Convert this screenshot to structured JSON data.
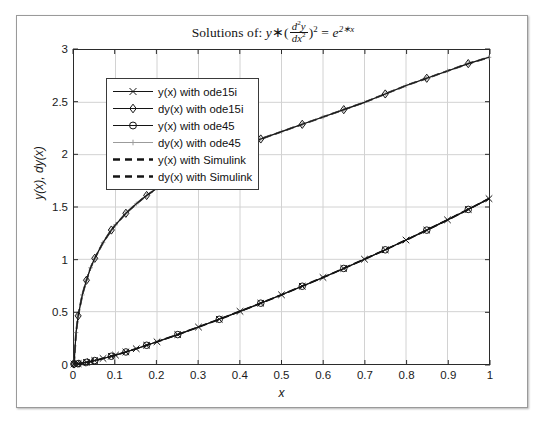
{
  "figure": {
    "title_parts": {
      "prefix": "Solutions of:",
      "y": "y",
      "times": "∗",
      "open_paren": "(",
      "num_d": "d",
      "num_sup": "2",
      "num_y": "y",
      "den_d": "d",
      "den_x": "x",
      "den_sup": "2",
      "close_paren": ")",
      "paren_sup": "2",
      "equals": "=",
      "e": "e",
      "e_sup": "2∗x"
    },
    "title_plain": "Solutions of: y * (d^2y/dx^2)^2 = e^(2*x)"
  },
  "axes": {
    "xlabel": "x",
    "ylabel": "y(x), dy(x)",
    "xticks": [
      "0",
      "0.1",
      "0.2",
      "0.3",
      "0.4",
      "0.5",
      "0.6",
      "0.7",
      "0.8",
      "0.9",
      "1"
    ],
    "yticks": [
      "0",
      "0.5",
      "1",
      "1.5",
      "2",
      "2.5",
      "3"
    ]
  },
  "legend": {
    "entries": [
      {
        "label": "y(x) with ode15i",
        "marker": "x-mark",
        "style": "solid",
        "color": "#141414"
      },
      {
        "label": "dy(x) with ode15i",
        "marker": "diamond",
        "style": "solid",
        "color": "#141414"
      },
      {
        "label": "y(x) with ode45",
        "marker": "circle",
        "style": "solid",
        "color": "#141414"
      },
      {
        "label": "dy(x) with ode45",
        "marker": "plus",
        "style": "solid",
        "color": "#9b9b9b"
      },
      {
        "label": "y(x) with Simulink",
        "marker": "none",
        "style": "dashed",
        "color": "#141414"
      },
      {
        "label": "dy(x) with Simulink",
        "marker": "none",
        "style": "dashed",
        "color": "#141414"
      }
    ]
  },
  "chart_data": {
    "type": "line",
    "xlabel": "x",
    "ylabel": "y(x), dy(x)",
    "xlim": [
      0,
      1
    ],
    "ylim": [
      0,
      3
    ],
    "xticks": [
      0,
      0.1,
      0.2,
      0.3,
      0.4,
      0.5,
      0.6,
      0.7,
      0.8,
      0.9,
      1
    ],
    "yticks": [
      0,
      0.5,
      1,
      1.5,
      2,
      2.5,
      3
    ],
    "grid": true,
    "legend_position": "upper left",
    "x": [
      0,
      0.005,
      0.01,
      0.02,
      0.03,
      0.04,
      0.05,
      0.07,
      0.09,
      0.1,
      0.125,
      0.15,
      0.175,
      0.2,
      0.25,
      0.3,
      0.35,
      0.4,
      0.45,
      0.5,
      0.55,
      0.6,
      0.65,
      0.7,
      0.75,
      0.8,
      0.85,
      0.9,
      0.95,
      1.0
    ],
    "series": [
      {
        "name": "dy(x) with ode15i",
        "marker": "diamond",
        "style": "solid",
        "values": [
          0,
          0.3,
          0.46,
          0.66,
          0.8,
          0.92,
          1.01,
          1.16,
          1.28,
          1.33,
          1.44,
          1.53,
          1.61,
          1.68,
          1.8,
          1.9,
          1.99,
          2.07,
          2.15,
          2.22,
          2.29,
          2.36,
          2.43,
          2.5,
          2.58,
          2.66,
          2.73,
          2.8,
          2.87,
          2.93
        ]
      },
      {
        "name": "dy(x) with ode45",
        "marker": "plus",
        "style": "solid",
        "values": [
          0,
          0.3,
          0.46,
          0.66,
          0.8,
          0.92,
          1.01,
          1.16,
          1.28,
          1.33,
          1.44,
          1.53,
          1.61,
          1.68,
          1.8,
          1.9,
          1.99,
          2.07,
          2.15,
          2.22,
          2.29,
          2.36,
          2.43,
          2.5,
          2.58,
          2.66,
          2.73,
          2.8,
          2.87,
          2.93
        ]
      },
      {
        "name": "dy(x) with Simulink",
        "marker": "none",
        "style": "dashed",
        "values": [
          0,
          0.3,
          0.46,
          0.66,
          0.8,
          0.92,
          1.01,
          1.16,
          1.28,
          1.33,
          1.44,
          1.53,
          1.61,
          1.68,
          1.8,
          1.9,
          1.99,
          2.07,
          2.15,
          2.22,
          2.29,
          2.36,
          2.43,
          2.5,
          2.58,
          2.66,
          2.73,
          2.8,
          2.87,
          2.93
        ]
      },
      {
        "name": "y(x) with ode15i",
        "marker": "x-mark",
        "style": "solid",
        "values": [
          0,
          0.0012,
          0.0033,
          0.009,
          0.016,
          0.024,
          0.033,
          0.053,
          0.074,
          0.085,
          0.115,
          0.146,
          0.179,
          0.212,
          0.281,
          0.353,
          0.427,
          0.503,
          0.581,
          0.661,
          0.743,
          0.827,
          0.913,
          1.001,
          1.091,
          1.184,
          1.279,
          1.377,
          1.477,
          1.58
        ]
      },
      {
        "name": "y(x) with ode45",
        "marker": "circle",
        "style": "solid",
        "values": [
          0,
          0.0012,
          0.0033,
          0.009,
          0.016,
          0.024,
          0.033,
          0.053,
          0.074,
          0.085,
          0.115,
          0.146,
          0.179,
          0.212,
          0.281,
          0.353,
          0.427,
          0.503,
          0.581,
          0.661,
          0.743,
          0.827,
          0.913,
          1.001,
          1.091,
          1.184,
          1.279,
          1.377,
          1.477,
          1.58
        ]
      },
      {
        "name": "y(x) with Simulink",
        "marker": "none",
        "style": "dashed",
        "values": [
          0,
          0.0012,
          0.0033,
          0.009,
          0.016,
          0.024,
          0.033,
          0.053,
          0.074,
          0.085,
          0.115,
          0.146,
          0.179,
          0.212,
          0.281,
          0.353,
          0.427,
          0.503,
          0.581,
          0.661,
          0.743,
          0.827,
          0.913,
          1.001,
          1.091,
          1.184,
          1.279,
          1.377,
          1.477,
          1.58
        ]
      }
    ]
  },
  "colors": {
    "curve": "#141414",
    "curve_gray": "#9b9b9b",
    "grid": "#d2d2d2",
    "axis": "#2b2b2b",
    "figure_border": "#9a9a9a"
  }
}
